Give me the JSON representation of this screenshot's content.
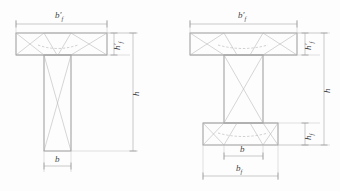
{
  "figure": {
    "type": "engineering-cross-section-diagram",
    "background_color": "#fdfdfd",
    "line_color": "#8f8f8f",
    "hatch_color": "#b4b4b4",
    "dimension_color": "#a8a8a8",
    "label_color": "#454545"
  },
  "sections": [
    {
      "id": "t-section",
      "name": "T-shaped cross section",
      "labels": {
        "top_flange_width": "b'f",
        "top_flange_width_base": "b",
        "top_flange_width_prime": "′",
        "top_flange_width_sub": "f",
        "flange_thickness_base": "h",
        "flange_thickness_prime": "′",
        "flange_thickness_sub": "f",
        "total_height": "h",
        "web_width": "b"
      }
    },
    {
      "id": "i-section",
      "name": "I-shaped cross section",
      "labels": {
        "top_flange_width_base": "b",
        "top_flange_width_prime": "′",
        "top_flange_width_sub": "f",
        "top_flange_thickness_base": "h",
        "top_flange_thickness_prime": "′",
        "top_flange_thickness_sub": "f",
        "total_height": "h",
        "bottom_flange_thickness_base": "h",
        "bottom_flange_thickness_sub": "f",
        "web_width": "b",
        "bottom_flange_width_base": "b",
        "bottom_flange_width_sub": "f"
      }
    }
  ]
}
